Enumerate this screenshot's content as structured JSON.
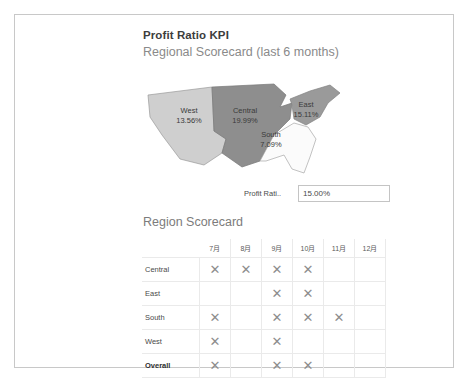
{
  "header": {
    "title": "Profit Ratio KPI",
    "subtitle": "Regional Scorecard (last 6 months)"
  },
  "map": {
    "regions": [
      {
        "name": "West",
        "value": "13.56%",
        "fill": "#cfcfcf"
      },
      {
        "name": "Central",
        "value": "19.99%",
        "fill": "#8e8e8e"
      },
      {
        "name": "East",
        "value": "15.11%",
        "fill": "#9a9a9a"
      },
      {
        "name": "South",
        "value": "7.09%",
        "fill": "#fbfbfb"
      }
    ]
  },
  "ratio_field": {
    "label": "Profit Rati..",
    "value": "15.00%"
  },
  "scorecard": {
    "title": "Region Scorecard",
    "corner_header": "",
    "columns": [
      "7月",
      "8月",
      "9月",
      "10月",
      "11月",
      "12月"
    ],
    "mark_icon": "✕",
    "rows": [
      {
        "label": "Central",
        "bold": false,
        "marks": [
          true,
          true,
          true,
          true,
          false,
          false
        ]
      },
      {
        "label": "East",
        "bold": false,
        "marks": [
          false,
          false,
          true,
          true,
          false,
          false
        ]
      },
      {
        "label": "South",
        "bold": false,
        "marks": [
          true,
          false,
          true,
          true,
          true,
          false
        ]
      },
      {
        "label": "West",
        "bold": false,
        "marks": [
          true,
          false,
          true,
          false,
          false,
          false
        ]
      },
      {
        "label": "Overall",
        "bold": true,
        "marks": [
          true,
          false,
          true,
          true,
          false,
          false
        ]
      }
    ]
  },
  "colors": {
    "frame_border": "#c8c8c8",
    "grid_line": "#eaeaea",
    "title_text": "#3d3d3d",
    "subtitle_text": "#8a8a8a",
    "mark": "#8d8d8d"
  }
}
